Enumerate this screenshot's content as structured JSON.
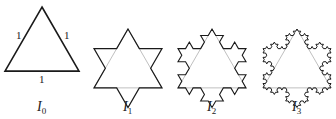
{
  "figure": {
    "stroke_color": "#1a1a1a",
    "guide_color": "#b8b8b8",
    "background": "#ffffff",
    "stages": [
      {
        "name": "I0",
        "label_main": "I",
        "label_sub": "0",
        "iteration": 0,
        "cx": 42,
        "apex_y": 7,
        "side": 74,
        "stroke_width": 1.6,
        "label_x": 37,
        "label_y": 111
      },
      {
        "name": "I1",
        "label_main": "I",
        "label_sub": "1",
        "iteration": 1,
        "cx": 128,
        "apex_y": 29,
        "side": 68,
        "stroke_width": 1.2,
        "label_x": 123,
        "label_y": 111
      },
      {
        "name": "I2",
        "label_main": "I",
        "label_sub": "2",
        "iteration": 2,
        "cx": 212,
        "apex_y": 29,
        "side": 68,
        "stroke_width": 1.1,
        "label_x": 207,
        "label_y": 111
      },
      {
        "name": "I3",
        "label_main": "I",
        "label_sub": "3",
        "iteration": 3,
        "cx": 297,
        "apex_y": 29,
        "side": 68,
        "stroke_width": 1.0,
        "label_x": 292,
        "label_y": 111
      }
    ],
    "side_labels": [
      {
        "text": "1",
        "x": 16,
        "y": 39
      },
      {
        "text": "1",
        "x": 64,
        "y": 39
      },
      {
        "text": "1",
        "x": 39,
        "y": 83
      }
    ]
  }
}
